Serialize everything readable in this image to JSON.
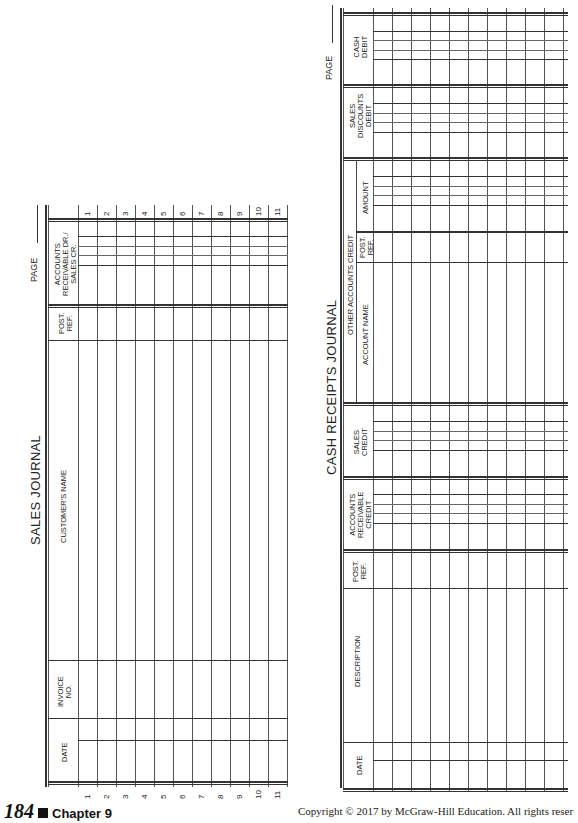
{
  "sales_journal": {
    "title": "SALES JOURNAL",
    "page_label": "PAGE",
    "columns": {
      "ar_dr_sales_cr": "ACCOUNTS RECEIVABLE DR./ SALES CR.",
      "ar_line1": "ACCOUNTS",
      "ar_line2": "RECEIVABLE DR./",
      "ar_line3": "SALES CR.",
      "post_ref_line1": "POST.",
      "post_ref_line2": "REF.",
      "customer_name": "CUSTOMER'S NAME",
      "invoice_line1": "INVOICE",
      "invoice_line2": "NO.",
      "date": "DATE"
    },
    "row_numbers": [
      "1",
      "2",
      "3",
      "4",
      "5",
      "6",
      "7",
      "8",
      "9",
      "10",
      "11"
    ]
  },
  "cash_receipts_journal": {
    "title": "CASH RECEIPTS JOURNAL",
    "page_label": "PAGE",
    "columns": {
      "cash_debit_line1": "CASH",
      "cash_debit_line2": "DEBIT",
      "sales_disc_line1": "SALES",
      "sales_disc_line2": "DISCOUNTS",
      "sales_disc_line3": "DEBIT",
      "other_accounts_credit": "OTHER ACCOUNTS CREDIT",
      "amount": "AMOUNT",
      "oa_post_ref_line1": "POST.",
      "oa_post_ref_line2": "REF.",
      "account_name": "ACCOUNT NAME",
      "sales_credit_line1": "SALES",
      "sales_credit_line2": "CREDIT",
      "ar_credit_line1": "ACCOUNTS",
      "ar_credit_line2": "RECEIVABLE",
      "ar_credit_line3": "CREDIT",
      "post_ref_line1": "POST.",
      "post_ref_line2": "REF.",
      "description": "DESCRIPTION",
      "date": "DATE"
    }
  },
  "footer": {
    "page_number": "184",
    "chapter": "Chapter 9",
    "copyright": "Copyright © 2017 by McGraw-Hill Education. All rights reser"
  }
}
